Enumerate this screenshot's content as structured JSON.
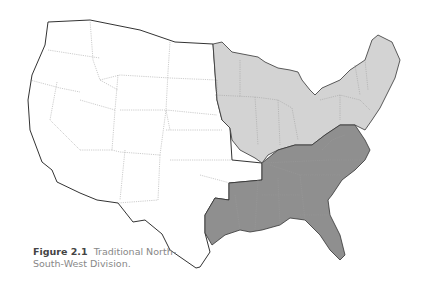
{
  "figure": {
    "label": "Figure 2.1",
    "caption_line1": "Traditional North-",
    "caption_line2": "South-West Division."
  },
  "map": {
    "title": "United States regional division",
    "regions": [
      {
        "name": "North",
        "color": "#d3d3d3"
      },
      {
        "name": "South",
        "color": "#8f8f8f"
      },
      {
        "name": "West",
        "color": "#ffffff"
      }
    ]
  }
}
